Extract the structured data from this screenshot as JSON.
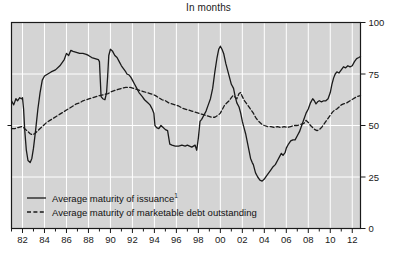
{
  "chart_data": {
    "type": "line",
    "title": "In months",
    "xlabel": "",
    "ylabel": "",
    "ylim": [
      0,
      100
    ],
    "yticks": [
      0,
      25,
      50,
      75,
      100
    ],
    "xlim": [
      1981.0,
      2012.75
    ],
    "xticks": [
      1982,
      1984,
      1986,
      1988,
      1990,
      1992,
      1994,
      1996,
      1998,
      2000,
      2002,
      2004,
      2006,
      2008,
      2010,
      2012
    ],
    "xtick_labels": [
      "82",
      "84",
      "86",
      "88",
      "90",
      "92",
      "94",
      "96",
      "98",
      "00",
      "02",
      "04",
      "06",
      "08",
      "10",
      "12"
    ],
    "minor_xticks_every": 1,
    "grid": "vertical-and-horizontal",
    "grid_color": "#ffffff",
    "plot_background": "#d4d4d4",
    "axis_color": "#1a1a1a",
    "y_axis_side": "right",
    "legend_position": "lower-left-inside",
    "series": [
      {
        "name": "Average maturity of issuance",
        "name_superscript": "1",
        "style": "solid",
        "color": "#1a1a1a",
        "points": [
          [
            1981.0,
            62.0
          ],
          [
            1981.2,
            60.0
          ],
          [
            1981.4,
            63.0
          ],
          [
            1981.55,
            62.0
          ],
          [
            1981.75,
            63.5
          ],
          [
            1981.9,
            63.0
          ],
          [
            1982.0,
            63.5
          ],
          [
            1982.1,
            58.0
          ],
          [
            1982.2,
            48.0
          ],
          [
            1982.35,
            38.0
          ],
          [
            1982.5,
            33.0
          ],
          [
            1982.7,
            32.0
          ],
          [
            1982.85,
            34.0
          ],
          [
            1983.0,
            39.0
          ],
          [
            1983.2,
            48.0
          ],
          [
            1983.4,
            58.0
          ],
          [
            1983.6,
            66.0
          ],
          [
            1983.8,
            72.0
          ],
          [
            1984.0,
            74.0
          ],
          [
            1984.3,
            75.0
          ],
          [
            1984.6,
            76.0
          ],
          [
            1985.0,
            77.0
          ],
          [
            1985.4,
            79.0
          ],
          [
            1985.8,
            82.0
          ],
          [
            1986.0,
            85.0
          ],
          [
            1986.2,
            84.0
          ],
          [
            1986.4,
            86.5
          ],
          [
            1986.6,
            86.0
          ],
          [
            1986.9,
            85.5
          ],
          [
            1987.2,
            85.0
          ],
          [
            1987.5,
            85.0
          ],
          [
            1987.8,
            84.5
          ],
          [
            1988.0,
            84.0
          ],
          [
            1988.3,
            83.0
          ],
          [
            1988.6,
            82.5
          ],
          [
            1988.9,
            82.0
          ],
          [
            1989.0,
            81.0
          ],
          [
            1989.15,
            64.0
          ],
          [
            1989.3,
            63.0
          ],
          [
            1989.5,
            62.5
          ],
          [
            1989.65,
            66.0
          ],
          [
            1989.75,
            74.0
          ],
          [
            1989.85,
            84.0
          ],
          [
            1990.0,
            87.0
          ],
          [
            1990.2,
            86.0
          ],
          [
            1990.4,
            84.0
          ],
          [
            1990.6,
            83.0
          ],
          [
            1990.8,
            81.0
          ],
          [
            1991.0,
            79.0
          ],
          [
            1991.2,
            77.5
          ],
          [
            1991.4,
            76.0
          ],
          [
            1991.5,
            75.0
          ],
          [
            1991.7,
            74.5
          ],
          [
            1991.85,
            73.5
          ],
          [
            1992.0,
            72.0
          ],
          [
            1992.2,
            70.0
          ],
          [
            1992.4,
            68.0
          ],
          [
            1992.6,
            66.0
          ],
          [
            1992.9,
            64.0
          ],
          [
            1993.1,
            62.5
          ],
          [
            1993.4,
            61.0
          ],
          [
            1993.6,
            60.0
          ],
          [
            1993.8,
            58.0
          ],
          [
            1993.95,
            56.0
          ],
          [
            1994.05,
            50.0
          ],
          [
            1994.2,
            49.0
          ],
          [
            1994.4,
            48.5
          ],
          [
            1994.6,
            50.0
          ],
          [
            1994.8,
            49.0
          ],
          [
            1995.0,
            48.0
          ],
          [
            1995.2,
            47.5
          ],
          [
            1995.4,
            41.0
          ],
          [
            1995.6,
            40.5
          ],
          [
            1995.9,
            40.0
          ],
          [
            1996.2,
            40.0
          ],
          [
            1996.5,
            40.5
          ],
          [
            1996.8,
            40.0
          ],
          [
            1997.0,
            40.5
          ],
          [
            1997.2,
            40.0
          ],
          [
            1997.4,
            39.5
          ],
          [
            1997.55,
            40.0
          ],
          [
            1997.7,
            40.5
          ],
          [
            1997.85,
            38.0
          ],
          [
            1998.0,
            44.0
          ],
          [
            1998.15,
            52.0
          ],
          [
            1998.3,
            53.0
          ],
          [
            1998.5,
            55.0
          ],
          [
            1998.7,
            57.0
          ],
          [
            1998.9,
            60.0
          ],
          [
            1999.1,
            63.0
          ],
          [
            1999.3,
            68.0
          ],
          [
            1999.5,
            76.0
          ],
          [
            1999.7,
            83.0
          ],
          [
            1999.85,
            87.0
          ],
          [
            2000.0,
            88.5
          ],
          [
            2000.15,
            87.0
          ],
          [
            2000.3,
            85.0
          ],
          [
            2000.5,
            80.0
          ],
          [
            2000.7,
            76.0
          ],
          [
            2000.85,
            73.0
          ],
          [
            2001.0,
            70.0
          ],
          [
            2001.2,
            68.0
          ],
          [
            2001.35,
            64.0
          ],
          [
            2001.5,
            61.0
          ],
          [
            2001.7,
            59.0
          ],
          [
            2001.85,
            56.0
          ],
          [
            2002.0,
            52.0
          ],
          [
            2002.15,
            49.0
          ],
          [
            2002.3,
            46.0
          ],
          [
            2002.45,
            42.0
          ],
          [
            2002.6,
            38.0
          ],
          [
            2002.75,
            34.0
          ],
          [
            2002.9,
            32.0
          ],
          [
            2003.0,
            31.0
          ],
          [
            2003.2,
            27.0
          ],
          [
            2003.4,
            25.0
          ],
          [
            2003.6,
            23.5
          ],
          [
            2003.8,
            23.0
          ],
          [
            2004.0,
            24.0
          ],
          [
            2004.2,
            25.5
          ],
          [
            2004.4,
            27.0
          ],
          [
            2004.6,
            28.5
          ],
          [
            2004.8,
            30.0
          ],
          [
            2005.0,
            31.0
          ],
          [
            2005.2,
            33.0
          ],
          [
            2005.4,
            35.0
          ],
          [
            2005.55,
            36.5
          ],
          [
            2005.7,
            35.5
          ],
          [
            2005.9,
            37.0
          ],
          [
            2006.0,
            39.0
          ],
          [
            2006.2,
            41.0
          ],
          [
            2006.4,
            42.5
          ],
          [
            2006.6,
            43.0
          ],
          [
            2006.8,
            43.0
          ],
          [
            2007.0,
            45.0
          ],
          [
            2007.2,
            47.0
          ],
          [
            2007.4,
            50.0
          ],
          [
            2007.6,
            53.0
          ],
          [
            2007.8,
            56.0
          ],
          [
            2008.0,
            58.0
          ],
          [
            2008.2,
            61.0
          ],
          [
            2008.4,
            63.0
          ],
          [
            2008.55,
            62.0
          ],
          [
            2008.7,
            60.5
          ],
          [
            2008.85,
            61.5
          ],
          [
            2009.0,
            62.0
          ],
          [
            2009.2,
            61.5
          ],
          [
            2009.4,
            62.0
          ],
          [
            2009.6,
            62.0
          ],
          [
            2009.8,
            63.0
          ],
          [
            2010.0,
            66.0
          ],
          [
            2010.15,
            70.0
          ],
          [
            2010.3,
            73.0
          ],
          [
            2010.45,
            75.0
          ],
          [
            2010.6,
            76.0
          ],
          [
            2010.8,
            75.5
          ],
          [
            2011.0,
            77.0
          ],
          [
            2011.2,
            78.5
          ],
          [
            2011.4,
            78.0
          ],
          [
            2011.6,
            79.0
          ],
          [
            2011.8,
            78.5
          ],
          [
            2012.0,
            79.0
          ],
          [
            2012.2,
            81.0
          ],
          [
            2012.4,
            82.5
          ],
          [
            2012.6,
            83.0
          ],
          [
            2012.75,
            83.5
          ]
        ]
      },
      {
        "name": "Average maturity of marketable debt outstanding",
        "style": "dashed",
        "color": "#1a1a1a",
        "points": [
          [
            1981.0,
            48.5
          ],
          [
            1981.3,
            48.5
          ],
          [
            1981.6,
            49.0
          ],
          [
            1981.9,
            49.5
          ],
          [
            1982.1,
            49.0
          ],
          [
            1982.3,
            48.0
          ],
          [
            1982.5,
            47.0
          ],
          [
            1982.7,
            46.0
          ],
          [
            1982.9,
            45.5
          ],
          [
            1983.1,
            46.0
          ],
          [
            1983.3,
            47.0
          ],
          [
            1983.6,
            48.5
          ],
          [
            1983.9,
            50.0
          ],
          [
            1984.2,
            51.5
          ],
          [
            1984.5,
            52.5
          ],
          [
            1984.8,
            53.5
          ],
          [
            1985.1,
            54.5
          ],
          [
            1985.4,
            55.5
          ],
          [
            1985.7,
            56.5
          ],
          [
            1986.0,
            57.5
          ],
          [
            1986.3,
            58.5
          ],
          [
            1986.6,
            59.5
          ],
          [
            1986.9,
            60.5
          ],
          [
            1987.2,
            61.0
          ],
          [
            1987.5,
            62.0
          ],
          [
            1987.8,
            62.5
          ],
          [
            1988.1,
            63.0
          ],
          [
            1988.4,
            63.5
          ],
          [
            1988.7,
            64.0
          ],
          [
            1989.0,
            64.5
          ],
          [
            1989.4,
            65.0
          ],
          [
            1989.8,
            65.5
          ],
          [
            1990.1,
            66.5
          ],
          [
            1990.4,
            67.0
          ],
          [
            1990.7,
            67.5
          ],
          [
            1991.0,
            68.0
          ],
          [
            1991.4,
            68.5
          ],
          [
            1991.8,
            68.5
          ],
          [
            1992.1,
            68.0
          ],
          [
            1992.4,
            67.5
          ],
          [
            1992.7,
            67.0
          ],
          [
            1993.0,
            66.5
          ],
          [
            1993.3,
            66.0
          ],
          [
            1993.6,
            65.5
          ],
          [
            1993.9,
            65.0
          ],
          [
            1994.1,
            64.5
          ],
          [
            1994.4,
            63.5
          ],
          [
            1994.7,
            62.5
          ],
          [
            1995.0,
            62.0
          ],
          [
            1995.3,
            61.0
          ],
          [
            1995.6,
            60.5
          ],
          [
            1995.9,
            60.0
          ],
          [
            1996.2,
            59.5
          ],
          [
            1996.5,
            58.5
          ],
          [
            1996.8,
            58.0
          ],
          [
            1997.1,
            57.5
          ],
          [
            1997.4,
            57.0
          ],
          [
            1997.7,
            56.5
          ],
          [
            1998.0,
            56.0
          ],
          [
            1998.3,
            55.5
          ],
          [
            1998.6,
            55.0
          ],
          [
            1998.9,
            54.5
          ],
          [
            1999.2,
            54.0
          ],
          [
            1999.5,
            54.0
          ],
          [
            1999.8,
            55.0
          ],
          [
            2000.0,
            56.0
          ],
          [
            2000.2,
            58.0
          ],
          [
            2000.4,
            60.0
          ],
          [
            2000.6,
            61.0
          ],
          [
            2000.8,
            62.0
          ],
          [
            2001.0,
            63.5
          ],
          [
            2001.15,
            64.5
          ],
          [
            2001.3,
            64.0
          ],
          [
            2001.5,
            63.0
          ],
          [
            2001.7,
            65.5
          ],
          [
            2001.85,
            66.0
          ],
          [
            2002.0,
            64.0
          ],
          [
            2002.2,
            62.0
          ],
          [
            2002.4,
            60.5
          ],
          [
            2002.6,
            59.0
          ],
          [
            2002.8,
            57.5
          ],
          [
            2003.0,
            56.0
          ],
          [
            2003.2,
            54.0
          ],
          [
            2003.4,
            52.5
          ],
          [
            2003.6,
            51.5
          ],
          [
            2003.8,
            50.5
          ],
          [
            2004.0,
            50.0
          ],
          [
            2004.3,
            49.5
          ],
          [
            2004.6,
            49.5
          ],
          [
            2004.9,
            49.0
          ],
          [
            2005.2,
            49.5
          ],
          [
            2005.5,
            49.0
          ],
          [
            2005.8,
            49.5
          ],
          [
            2006.1,
            49.0
          ],
          [
            2006.4,
            49.5
          ],
          [
            2006.7,
            50.0
          ],
          [
            2007.0,
            50.0
          ],
          [
            2007.3,
            50.5
          ],
          [
            2007.6,
            51.0
          ],
          [
            2007.8,
            52.5
          ],
          [
            2008.0,
            51.5
          ],
          [
            2008.2,
            50.0
          ],
          [
            2008.4,
            49.0
          ],
          [
            2008.6,
            48.0
          ],
          [
            2008.8,
            47.5
          ],
          [
            2009.0,
            48.0
          ],
          [
            2009.2,
            49.0
          ],
          [
            2009.4,
            50.5
          ],
          [
            2009.6,
            52.0
          ],
          [
            2009.8,
            53.5
          ],
          [
            2010.0,
            55.0
          ],
          [
            2010.2,
            56.5
          ],
          [
            2010.4,
            57.5
          ],
          [
            2010.6,
            58.0
          ],
          [
            2010.8,
            59.0
          ],
          [
            2011.0,
            60.0
          ],
          [
            2011.2,
            60.5
          ],
          [
            2011.5,
            61.0
          ],
          [
            2011.8,
            62.0
          ],
          [
            2012.1,
            63.0
          ],
          [
            2012.4,
            64.0
          ],
          [
            2012.75,
            64.5
          ]
        ]
      }
    ],
    "legend": [
      {
        "label": "Average maturity of issuance",
        "superscript": "1",
        "style": "solid"
      },
      {
        "label": "Average maturity of marketable debt outstanding",
        "superscript": "",
        "style": "dashed"
      }
    ]
  }
}
